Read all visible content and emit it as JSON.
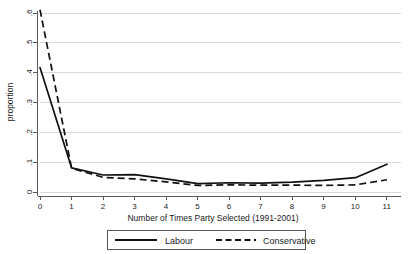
{
  "chart_data": {
    "type": "line",
    "title": "",
    "subtitle": "",
    "xlabel": "Number of Times Party Selected (1991-2001)",
    "ylabel": "proportion",
    "x": [
      0,
      1,
      2,
      3,
      4,
      5,
      6,
      7,
      8,
      9,
      10,
      11
    ],
    "xtick_labels": [
      "0",
      "1",
      "2",
      "3",
      "4",
      "5",
      "6",
      "7",
      "8",
      "9",
      "10",
      "11"
    ],
    "ytick_labels": [
      "0",
      ".1",
      ".2",
      ".3",
      ".4",
      ".5",
      ".6"
    ],
    "ytick_values": [
      0,
      0.1,
      0.2,
      0.3,
      0.4,
      0.5,
      0.6
    ],
    "xlim": [
      0,
      11
    ],
    "ylim": [
      0,
      0.6
    ],
    "grid": "horizontal",
    "legend_position": "bottom",
    "series": [
      {
        "name": "Labour",
        "style": "solid",
        "color": "#111111",
        "values": [
          0.417,
          0.081,
          0.057,
          0.058,
          0.044,
          0.028,
          0.031,
          0.03,
          0.033,
          0.039,
          0.048,
          0.093
        ]
      },
      {
        "name": "Conservative",
        "style": "dashed",
        "color": "#111111",
        "values": [
          0.611,
          0.08,
          0.049,
          0.044,
          0.034,
          0.022,
          0.024,
          0.023,
          0.023,
          0.022,
          0.024,
          0.041
        ]
      }
    ]
  },
  "legend": {
    "entries": [
      {
        "label": "Labour",
        "style": "solid"
      },
      {
        "label": "Conservative",
        "style": "dashed"
      }
    ]
  },
  "geometry": {
    "plot_left": 40,
    "plot_right": 387,
    "plot_top": 13,
    "plot_bottom": 192,
    "grid_right": 401
  }
}
